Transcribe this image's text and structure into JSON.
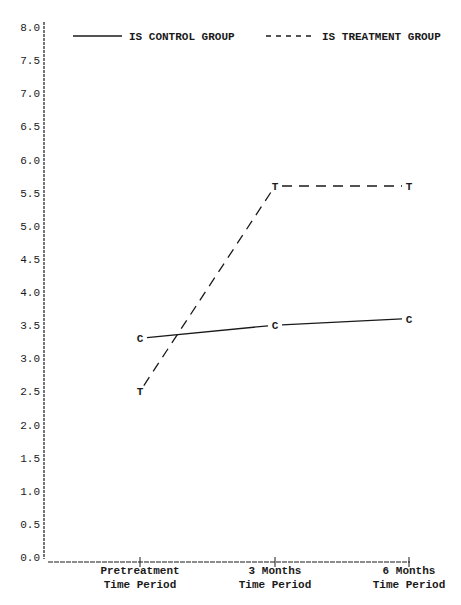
{
  "chart_data": {
    "type": "line",
    "title": "",
    "xlabel": "",
    "ylabel": "",
    "ylim": [
      0.0,
      8.0
    ],
    "y_ticks": [
      "0.0",
      "0.5",
      "1.0",
      "1.5",
      "2.0",
      "2.5",
      "3.0",
      "3.5",
      "4.0",
      "4.5",
      "5.0",
      "5.5",
      "6.0",
      "6.5",
      "7.0",
      "7.5",
      "8.0"
    ],
    "categories": [
      {
        "line1": "Pretreatment",
        "line2": "Time Period"
      },
      {
        "line1": "3 Months",
        "line2": "Time Period"
      },
      {
        "line1": "6 Months",
        "line2": "Time Period"
      }
    ],
    "series": [
      {
        "name": "IS CONTROL GROUP",
        "marker": "C",
        "style": "solid",
        "values": [
          3.3,
          3.5,
          3.6
        ]
      },
      {
        "name": "IS TREATMENT GROUP",
        "marker": "T",
        "style": "dashed",
        "values": [
          2.5,
          5.6,
          5.6
        ]
      }
    ],
    "legend": {
      "position": "top",
      "entries": [
        "IS CONTROL GROUP",
        "IS TREATMENT GROUP"
      ]
    },
    "grid": false
  },
  "colors": {
    "ink": "#1a1a1a",
    "background": "#ffffff"
  }
}
